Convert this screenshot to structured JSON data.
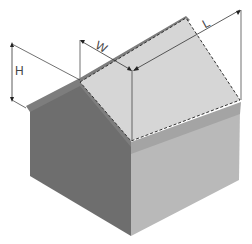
{
  "diagram": {
    "labels": {
      "height": "H",
      "width": "W",
      "length": "L"
    },
    "colors": {
      "left_wall": "#6e6e6e",
      "left_roof": "#7a7a7a",
      "right_roof": "#d4d4d4",
      "right_wall": "#b8b8b8",
      "eave_band": "#a6a6a6",
      "dimension_line": "#333333",
      "dashed_outline": "#333333"
    }
  }
}
